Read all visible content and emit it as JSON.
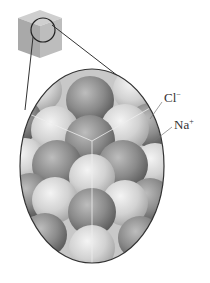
{
  "figure": {
    "labels": [
      {
        "id": "chloride",
        "text": "Cl",
        "charge": "−"
      },
      {
        "id": "sodium",
        "text": "Na",
        "charge": "+"
      }
    ],
    "colors": {
      "chloride_ion": "#8a8a8a",
      "sodium_ion": "#d4d4d4",
      "cube": "#a9a9a9",
      "outline": "#333333"
    }
  }
}
